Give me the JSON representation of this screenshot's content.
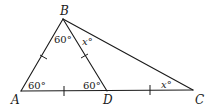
{
  "diagram": {
    "type": "geometry-triangle",
    "vertices": {
      "A": "A",
      "B": "B",
      "C": "C",
      "D": "D"
    },
    "segments": [
      "AB",
      "BC",
      "AC",
      "BD"
    ],
    "congruent_marks": [
      "AB",
      "BD",
      "AD",
      "DC"
    ],
    "angles": {
      "A": "60°",
      "ABD": "60°",
      "DBC": "x°",
      "BDA": "60°",
      "C": "x°"
    }
  }
}
